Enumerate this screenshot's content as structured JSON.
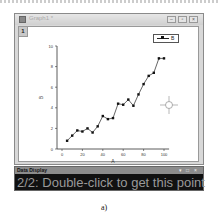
{
  "window": {
    "title": "Graph1 *",
    "layer_tab": "1",
    "buttons": [
      "minimize",
      "restore",
      "close"
    ]
  },
  "legend": {
    "label": "B"
  },
  "cursor": {
    "type": "crosshair",
    "x": 168,
    "y": 104
  },
  "data_display": {
    "title": "Data Display",
    "controls": [
      "pin",
      "restore",
      "close"
    ],
    "message": "2/2: Double-click to get this point"
  },
  "caption": "a)",
  "colors": {
    "plot_line": "#222222",
    "marker": "#111111",
    "panel_bg": "#111111",
    "panel_text": "#999999"
  },
  "chart_data": {
    "type": "line",
    "title": "",
    "xlabel": "A",
    "ylabel": "B",
    "xlim": [
      -5,
      105
    ],
    "ylim": [
      0,
      10
    ],
    "x_ticks": [
      0,
      20,
      40,
      60,
      80,
      100
    ],
    "y_ticks": [
      0,
      2,
      4,
      6,
      8,
      10
    ],
    "grid": false,
    "legend_position": "top-right",
    "series": [
      {
        "name": "B",
        "x": [
          5,
          10,
          15,
          20,
          25,
          30,
          35,
          40,
          45,
          50,
          55,
          60,
          65,
          70,
          75,
          80,
          85,
          90,
          95,
          100
        ],
        "values": [
          0.8,
          1.3,
          1.8,
          1.7,
          2.0,
          1.6,
          2.2,
          3.2,
          2.9,
          3.0,
          4.4,
          4.3,
          4.8,
          4.2,
          5.3,
          6.3,
          7.1,
          7.4,
          8.8,
          8.8
        ]
      }
    ]
  }
}
